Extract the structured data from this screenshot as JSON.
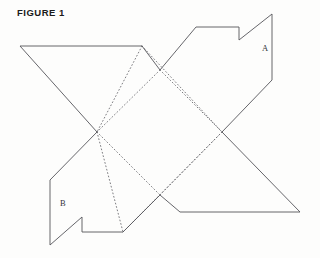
{
  "figure": {
    "title": "FIGURE 1",
    "canvas": {
      "width": 320,
      "height": 258
    },
    "background_color": "#fdfdfc",
    "cut_line_color": "#55555a",
    "fold_line_color": "#6e6e73",
    "label_color": "#33333a"
  },
  "labels": [
    {
      "id": "A",
      "text": "A",
      "x": 262,
      "y": 51
    },
    {
      "id": "B",
      "text": "B",
      "x": 60,
      "y": 206
    }
  ],
  "outline": {
    "name": "cut-outline",
    "style": "solid",
    "closed": true,
    "points": [
      [
        20,
        46
      ],
      [
        142,
        46
      ],
      [
        160,
        70
      ],
      [
        196,
        27
      ],
      [
        239,
        27
      ],
      [
        239,
        40
      ],
      [
        272,
        14
      ],
      [
        272,
        80
      ],
      [
        222,
        132
      ],
      [
        300,
        212
      ],
      [
        180,
        212
      ],
      [
        160,
        195
      ],
      [
        123,
        232
      ],
      [
        82,
        232
      ],
      [
        82,
        217
      ],
      [
        50,
        245
      ],
      [
        50,
        180
      ],
      [
        97,
        132
      ]
    ]
  },
  "fold_lines": [
    {
      "name": "fold-top-left",
      "style": "dotted",
      "points": [
        [
          142,
          46
        ],
        [
          97,
          132
        ]
      ]
    },
    {
      "name": "fold-top-right",
      "style": "dotted",
      "points": [
        [
          142,
          46
        ],
        [
          222,
          132
        ]
      ]
    },
    {
      "name": "fold-bottom-left",
      "style": "dotted",
      "points": [
        [
          97,
          132
        ],
        [
          160,
          195
        ]
      ]
    },
    {
      "name": "fold-bottom-right",
      "style": "dotted",
      "points": [
        [
          222,
          132
        ],
        [
          160,
          195
        ]
      ]
    },
    {
      "name": "fold-upper-diagonal",
      "style": "dotted",
      "points": [
        [
          160,
          70
        ],
        [
          222,
          132
        ]
      ]
    },
    {
      "name": "fold-left-diagonal",
      "style": "dotted",
      "points": [
        [
          160,
          70
        ],
        [
          97,
          132
        ]
      ]
    },
    {
      "name": "fold-lower-left-diagonal",
      "style": "dotted",
      "points": [
        [
          97,
          132
        ],
        [
          123,
          232
        ]
      ]
    },
    {
      "name": "fold-lower-right-diagonal",
      "style": "dotted",
      "points": [
        [
          123,
          232
        ],
        [
          222,
          132
        ]
      ]
    }
  ]
}
